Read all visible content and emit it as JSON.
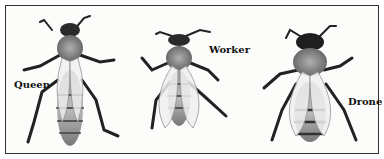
{
  "figure": {
    "labels": {
      "queen": "Queen",
      "worker": "Worker",
      "drone": "Drone"
    },
    "colors": {
      "border": "#333333",
      "background": "#fcfcfb",
      "body_dark": "#2a2a2a",
      "body_mid": "#8a8a8a",
      "wing": "#e8e8e8"
    }
  }
}
